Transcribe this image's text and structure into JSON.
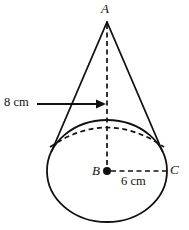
{
  "figure": {
    "shape": "cone",
    "background_color": "#ffffff",
    "stroke_color": "#111111"
  },
  "labels": {
    "apex": "A",
    "base_center": "B",
    "base_edge": "C",
    "height_measure": "8 cm",
    "radius_measure": "6 cm"
  },
  "geometry": {
    "apex_point": {
      "x": 107,
      "y": 22
    },
    "base_center_point": {
      "x": 107,
      "y": 171
    },
    "base_edge_point": {
      "x": 167,
      "y": 171
    },
    "base_radius_x": 60,
    "base_radius_y": 51,
    "height_pixels": 149
  },
  "annotations": {
    "height_line": "dashed vertical segment from A to B",
    "radius_line": "dashed horizontal segment from B to C",
    "hidden_base_arc": "dashed elliptical arc for far side of base",
    "leader_arrow": "arrow from 8 cm label pointing right to the height line"
  }
}
